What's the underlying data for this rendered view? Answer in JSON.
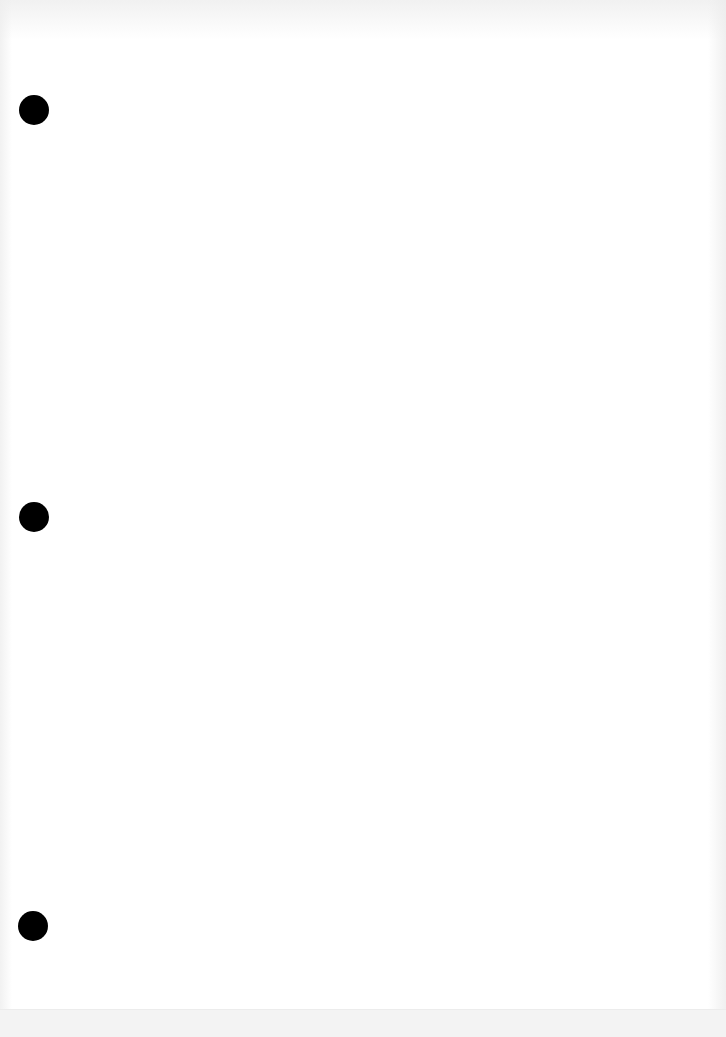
{
  "document": {
    "type": "blank-page",
    "background_color": "#ffffff",
    "text_content": "",
    "punch_holes": [
      {
        "position": "top",
        "x": 19,
        "y": 95,
        "diameter": 30,
        "color": "#000000"
      },
      {
        "position": "middle",
        "x": 19,
        "y": 502,
        "diameter": 30,
        "color": "#000000"
      },
      {
        "position": "bottom",
        "x": 18,
        "y": 911,
        "diameter": 30,
        "color": "#000000"
      }
    ]
  }
}
